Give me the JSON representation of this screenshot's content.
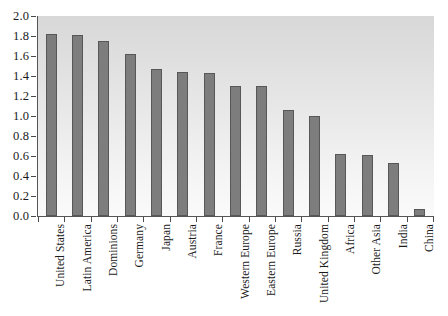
{
  "chart_data": {
    "type": "bar",
    "title": "",
    "subtitle": "",
    "xlabel": "",
    "ylabel": "",
    "ylim": [
      0.0,
      2.0
    ],
    "ytick_step": 0.2,
    "grid": false,
    "legend": "none",
    "bar_color": "#7d7d7d",
    "bar_edge_color": "#575757",
    "plot_background": "#e6e6e6",
    "axis_color": "#555555",
    "categories": [
      "United States",
      "Latin America",
      "Dominions",
      "Germany",
      "Japan",
      "Austria",
      "France",
      "Western Europe",
      "Eastern Europe",
      "Russia",
      "United Kingdom",
      "Africa",
      "Other Asia",
      "India",
      "China"
    ],
    "values": [
      1.82,
      1.81,
      1.75,
      1.62,
      1.47,
      1.44,
      1.43,
      1.3,
      1.3,
      1.06,
      1.0,
      0.62,
      0.61,
      0.53,
      0.07
    ],
    "ytick_labels": [
      "0.0",
      "0.2",
      "0.4",
      "0.6",
      "0.8",
      "1.0",
      "1.2",
      "1.4",
      "1.6",
      "1.8",
      "2.0"
    ],
    "ytick_values": [
      0.0,
      0.2,
      0.4,
      0.6,
      0.8,
      1.0,
      1.2,
      1.4,
      1.6,
      1.8,
      2.0
    ]
  }
}
